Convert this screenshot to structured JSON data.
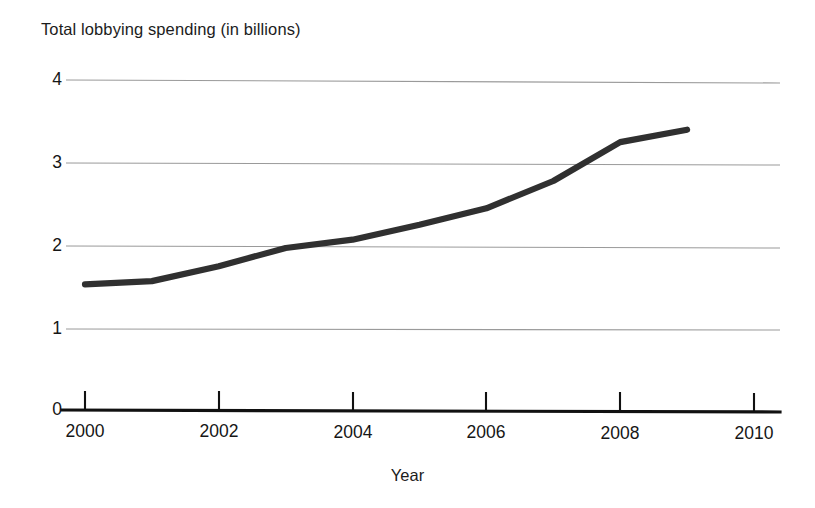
{
  "chart_data": {
    "type": "line",
    "title": "Total lobbying spending (in billions)",
    "xlabel": "Year",
    "ylabel": "",
    "x": [
      2000,
      2001,
      2002,
      2003,
      2004,
      2005,
      2006,
      2007,
      2008,
      2009
    ],
    "values": [
      1.53,
      1.57,
      1.75,
      1.97,
      2.07,
      2.25,
      2.45,
      2.78,
      3.25,
      3.4
    ],
    "series": [
      {
        "name": "Total lobbying spending",
        "values": [
          1.53,
          1.57,
          1.75,
          1.97,
          2.07,
          2.25,
          2.45,
          2.78,
          3.25,
          3.4
        ]
      }
    ],
    "xlim": [
      2000,
      2010
    ],
    "ylim": [
      0,
      4
    ],
    "xticks": [
      2000,
      2002,
      2004,
      2006,
      2008,
      2010
    ],
    "yticks": [
      0,
      1,
      2,
      3,
      4
    ],
    "xtick_labels": [
      "2000",
      "2002",
      "2004",
      "2006",
      "2008",
      "2010"
    ],
    "ytick_labels": [
      "0",
      "1",
      "2",
      "3",
      "4"
    ],
    "grid": "horizontal",
    "legend": "none",
    "line_color": "#303030",
    "grid_color": "#9a9a9a",
    "axis_color": "#111111"
  }
}
